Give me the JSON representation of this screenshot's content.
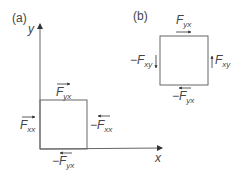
{
  "panel_a": {
    "label": "(a)",
    "axes": {
      "y_label": "y",
      "x_label": "x"
    },
    "forces": {
      "top": {
        "symbol": "F",
        "sub": "yx",
        "sign": ""
      },
      "left": {
        "symbol": "F",
        "sub": "xx",
        "sign": ""
      },
      "right": {
        "symbol": "F",
        "sub": "xx",
        "sign": "−"
      },
      "bottom": {
        "symbol": "F",
        "sub": "yx",
        "sign": "−"
      }
    }
  },
  "panel_b": {
    "label": "(b)",
    "forces": {
      "top": {
        "symbol": "F",
        "sub": "yx",
        "sign": ""
      },
      "left": {
        "symbol": "F",
        "sub": "xy",
        "sign": "−"
      },
      "right": {
        "symbol": "F",
        "sub": "xy",
        "sign": ""
      },
      "bottom": {
        "symbol": "F",
        "sub": "yx",
        "sign": "−"
      }
    }
  },
  "colors": {
    "line": "#555555",
    "text": "#444444",
    "background": "#ffffff"
  }
}
